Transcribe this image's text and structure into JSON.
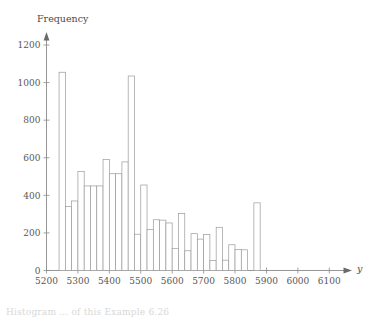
{
  "chart_data": {
    "type": "bar",
    "title": "",
    "subtitle": "",
    "xlabel": "y",
    "ylabel": "Frequency",
    "xlim": [
      5200,
      6150
    ],
    "ylim": [
      0,
      1250
    ],
    "grid": false,
    "legend": null,
    "bin_width": 20,
    "x_ticks": [
      5200,
      5300,
      5400,
      5500,
      5600,
      5700,
      5800,
      5900,
      6000,
      6100
    ],
    "y_ticks": [
      0,
      200,
      400,
      600,
      800,
      1000,
      1200
    ],
    "bins": [
      {
        "start": 5220,
        "end": 5240,
        "value": 0
      },
      {
        "start": 5240,
        "end": 5260,
        "value": 1055
      },
      {
        "start": 5260,
        "end": 5280,
        "value": 340
      },
      {
        "start": 5280,
        "end": 5300,
        "value": 370
      },
      {
        "start": 5300,
        "end": 5320,
        "value": 527
      },
      {
        "start": 5320,
        "end": 5340,
        "value": 450
      },
      {
        "start": 5340,
        "end": 5360,
        "value": 450
      },
      {
        "start": 5360,
        "end": 5380,
        "value": 450
      },
      {
        "start": 5380,
        "end": 5400,
        "value": 590
      },
      {
        "start": 5400,
        "end": 5420,
        "value": 515
      },
      {
        "start": 5420,
        "end": 5440,
        "value": 515
      },
      {
        "start": 5440,
        "end": 5460,
        "value": 578
      },
      {
        "start": 5460,
        "end": 5480,
        "value": 1035
      },
      {
        "start": 5480,
        "end": 5500,
        "value": 193
      },
      {
        "start": 5500,
        "end": 5520,
        "value": 455
      },
      {
        "start": 5520,
        "end": 5540,
        "value": 218
      },
      {
        "start": 5540,
        "end": 5560,
        "value": 270
      },
      {
        "start": 5560,
        "end": 5580,
        "value": 268
      },
      {
        "start": 5580,
        "end": 5600,
        "value": 253
      },
      {
        "start": 5600,
        "end": 5620,
        "value": 118
      },
      {
        "start": 5620,
        "end": 5640,
        "value": 303
      },
      {
        "start": 5640,
        "end": 5660,
        "value": 105
      },
      {
        "start": 5660,
        "end": 5680,
        "value": 196
      },
      {
        "start": 5680,
        "end": 5700,
        "value": 167
      },
      {
        "start": 5700,
        "end": 5720,
        "value": 192
      },
      {
        "start": 5720,
        "end": 5740,
        "value": 53
      },
      {
        "start": 5740,
        "end": 5760,
        "value": 230
      },
      {
        "start": 5760,
        "end": 5780,
        "value": 55
      },
      {
        "start": 5780,
        "end": 5800,
        "value": 137
      },
      {
        "start": 5800,
        "end": 5820,
        "value": 112
      },
      {
        "start": 5820,
        "end": 5840,
        "value": 110
      },
      {
        "start": 5840,
        "end": 5860,
        "value": 0
      },
      {
        "start": 5860,
        "end": 5880,
        "value": 360
      }
    ]
  },
  "caption": {
    "text": "Histogram ... of this Example 6.26"
  }
}
